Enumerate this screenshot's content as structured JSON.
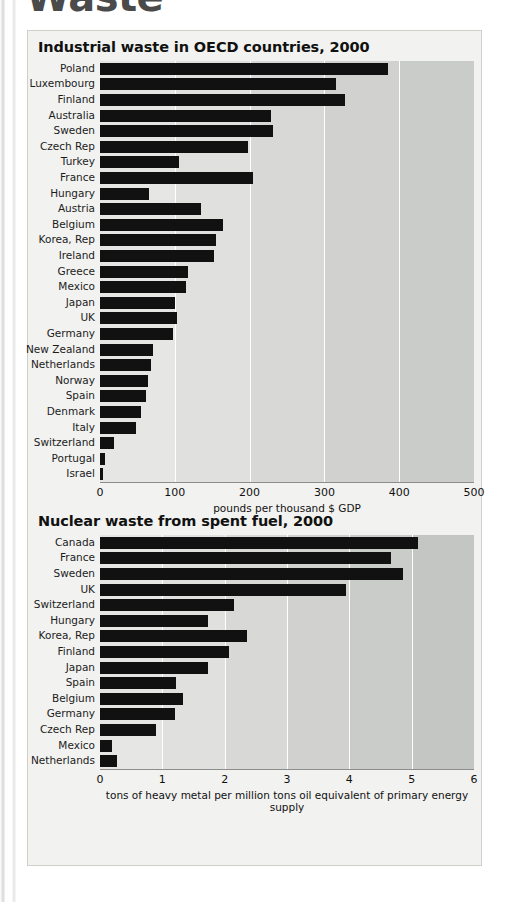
{
  "page": {
    "heading_cropped": "Waste"
  },
  "chart_data": [
    {
      "type": "bar",
      "orientation": "horizontal",
      "title": "Industrial waste in OECD countries, 2000",
      "xlabel": "pounds per thousand $ GDP",
      "ylabel": "",
      "xlim": [
        0,
        500
      ],
      "xticks": [
        0,
        100,
        200,
        300,
        400,
        500
      ],
      "xtick_labels": [
        "0",
        "100",
        "200",
        "300",
        "400",
        "500"
      ],
      "grid": true,
      "legend": "none",
      "bar_color": "#111111",
      "categories": [
        "Poland",
        "Luxembourg",
        "Finland",
        "Australia",
        "Sweden",
        "Czech Rep",
        "Turkey",
        "France",
        "Hungary",
        "Austria",
        "Belgium",
        "Korea, Rep",
        "Ireland",
        "Greece",
        "Mexico",
        "Japan",
        "UK",
        "Germany",
        "New Zealand",
        "Netherlands",
        "Norway",
        "Spain",
        "Denmark",
        "Italy",
        "Switzerland",
        "Portugal",
        "Israel"
      ],
      "values": [
        385,
        315,
        327,
        228,
        231,
        198,
        105,
        204,
        66,
        135,
        165,
        155,
        152,
        118,
        115,
        100,
        103,
        97,
        71,
        68,
        64,
        61,
        55,
        48,
        19,
        7,
        4
      ]
    },
    {
      "type": "bar",
      "orientation": "horizontal",
      "title": "Nuclear waste from spent fuel, 2000",
      "xlabel": "tons of heavy metal per million tons oil equivalent of primary energy supply",
      "ylabel": "",
      "xlim": [
        0,
        6
      ],
      "xticks": [
        0,
        1,
        2,
        3,
        4,
        5,
        6
      ],
      "xtick_labels": [
        "0",
        "1",
        "2",
        "3",
        "4",
        "5",
        "6"
      ],
      "grid": true,
      "legend": "none",
      "bar_color": "#111111",
      "categories": [
        "Canada",
        "France",
        "Sweden",
        "UK",
        "Switzerland",
        "Hungary",
        "Korea, Rep",
        "Finland",
        "Japan",
        "Spain",
        "Belgium",
        "Germany",
        "Czech Rep",
        "Mexico",
        "Netherlands"
      ],
      "values": [
        5.1,
        4.67,
        4.86,
        3.95,
        2.15,
        1.74,
        2.36,
        2.07,
        1.73,
        1.22,
        1.33,
        1.21,
        0.9,
        0.2,
        0.28
      ]
    }
  ]
}
